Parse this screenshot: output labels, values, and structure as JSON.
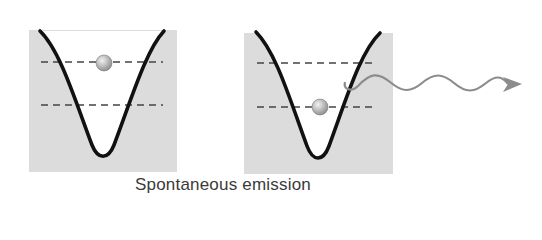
{
  "caption": "Spontaneous emission",
  "colors": {
    "background": "#ffffff",
    "box_fill": "#dcdcdc",
    "curve": "#111111",
    "dashed_level": "#444444",
    "particle_light": "#f2f2f2",
    "particle_dark": "#8a8a8a",
    "photon": "#8c8c8c"
  },
  "panels": [
    {
      "name": "before-emission",
      "energy_levels": [
        "upper",
        "lower"
      ],
      "particle_level": "upper",
      "photon_emitted": false
    },
    {
      "name": "after-emission",
      "energy_levels": [
        "upper",
        "lower"
      ],
      "particle_level": "lower",
      "photon_emitted": true
    }
  ]
}
